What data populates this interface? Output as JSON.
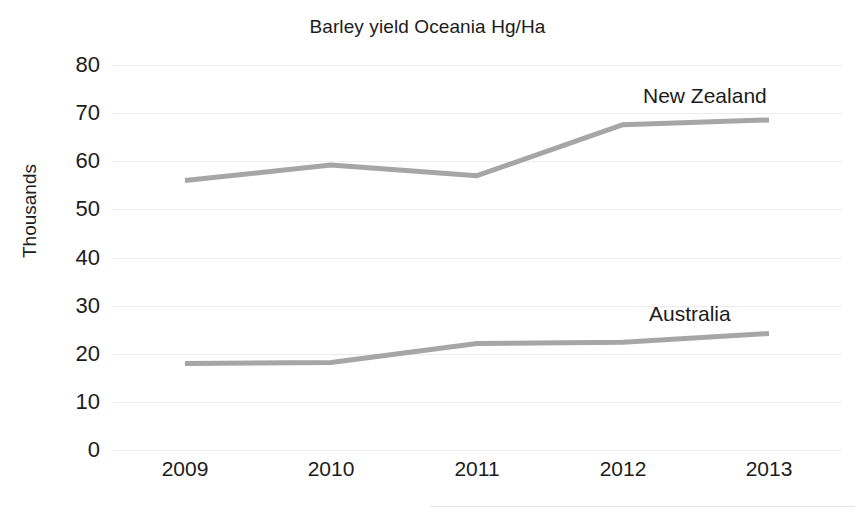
{
  "chart_data": {
    "type": "line",
    "title": "Barley yield Oceania Hg/Ha",
    "xlabel": "",
    "ylabel": "Thousands",
    "categories": [
      "2009",
      "2010",
      "2011",
      "2012",
      "2013"
    ],
    "x": [
      2009,
      2010,
      2011,
      2012,
      2013
    ],
    "series": [
      {
        "name": "New Zealand",
        "values": [
          56.0,
          59.2,
          57.0,
          67.6,
          68.6
        ],
        "color": "#a6a6a6",
        "label_position": "inline-above-right"
      },
      {
        "name": "Australia",
        "values": [
          18.0,
          18.2,
          22.1,
          22.4,
          24.2
        ],
        "color": "#a6a6a6",
        "label_position": "inline-above-right"
      }
    ],
    "ylim": [
      0,
      80
    ],
    "ytick_labels": [
      "0",
      "10",
      "20",
      "30",
      "40",
      "50",
      "60",
      "70",
      "80"
    ],
    "ytick_values": [
      0,
      10,
      20,
      30,
      40,
      50,
      60,
      70,
      80
    ],
    "grid": "horizontal",
    "grid_color": "#ededed",
    "legend": "none (series labeled inline)",
    "markers": "none",
    "line_width_px": 5,
    "background": "#ffffff"
  }
}
